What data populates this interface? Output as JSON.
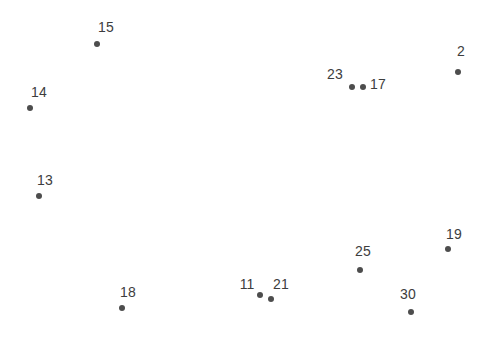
{
  "figure": {
    "width": 492,
    "height": 363,
    "background_color": "#ffffff",
    "point_color": "#4d4d4d",
    "label_color": "#3d3d3d",
    "point_diameter": 6,
    "label_font_size": 14
  },
  "chart_data": {
    "type": "scatter",
    "title": "",
    "subtitle": "",
    "xlabel": "",
    "ylabel": "",
    "xlim": [
      0,
      492
    ],
    "ylim": [
      0,
      363
    ],
    "grid": false,
    "axes_visible": false,
    "legend": false,
    "legend_position": "none",
    "series": [
      {
        "name": "points",
        "marker": "circle",
        "color": "#4d4d4d",
        "points": [
          {
            "label": "15",
            "x": 97,
            "y": 44,
            "label_x": 106,
            "label_y": 27
          },
          {
            "label": "14",
            "x": 30,
            "y": 108,
            "label_x": 39,
            "label_y": 92
          },
          {
            "label": "13",
            "x": 39,
            "y": 196,
            "label_x": 45,
            "label_y": 180
          },
          {
            "label": "23",
            "x": 352,
            "y": 87,
            "label_x": 335,
            "label_y": 74
          },
          {
            "label": "17",
            "x": 363,
            "y": 87,
            "label_x": 378,
            "label_y": 84
          },
          {
            "label": "2",
            "x": 458,
            "y": 72,
            "label_x": 461,
            "label_y": 51
          },
          {
            "label": "19",
            "x": 448,
            "y": 249,
            "label_x": 454,
            "label_y": 234
          },
          {
            "label": "25",
            "x": 360,
            "y": 270,
            "label_x": 363,
            "label_y": 251
          },
          {
            "label": "30",
            "x": 411,
            "y": 312,
            "label_x": 408,
            "label_y": 294
          },
          {
            "label": "11",
            "x": 260,
            "y": 295,
            "label_x": 247,
            "label_y": 284
          },
          {
            "label": "21",
            "x": 271,
            "y": 299,
            "label_x": 281,
            "label_y": 284
          },
          {
            "label": "18",
            "x": 122,
            "y": 308,
            "label_x": 128,
            "label_y": 292
          }
        ]
      }
    ],
    "labels": [
      "15",
      "14",
      "13",
      "23",
      "17",
      "2",
      "19",
      "25",
      "30",
      "11",
      "21",
      "18"
    ],
    "x": [
      97,
      30,
      39,
      352,
      363,
      458,
      448,
      360,
      411,
      260,
      271,
      122
    ],
    "y": [
      44,
      108,
      196,
      87,
      87,
      72,
      249,
      270,
      312,
      295,
      299,
      308
    ]
  }
}
